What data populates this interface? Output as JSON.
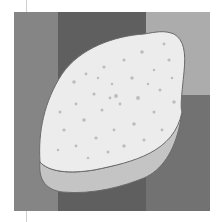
{
  "image": {
    "description": "Grayscale photo of a lemon-shaped slice with small holes (cheese/bread-like) on a banded gray background",
    "colors": {
      "band_left": "#858585",
      "band_center": "#5f5f5f",
      "band_right_top": "#acacac",
      "band_right_bottom": "#727272",
      "object_top": "#ececec",
      "object_side": "#c4c4c4",
      "object_outline": "#6a6a6a",
      "spots": "#b8b8b8"
    }
  }
}
